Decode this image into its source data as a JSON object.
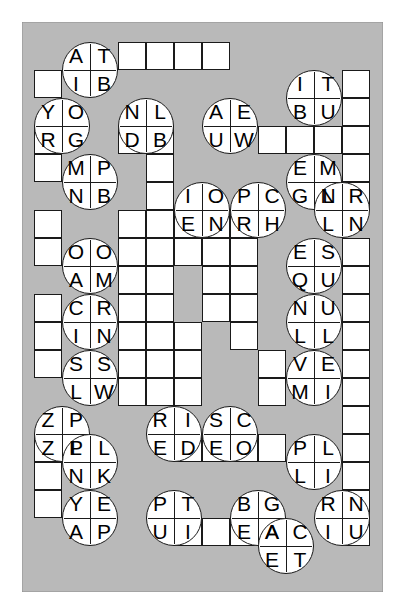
{
  "puzzle": {
    "title": "Letter Bubble Crossword Grid",
    "type": "crossword-bubble-grid",
    "grid": {
      "columns": 12,
      "rows": 19,
      "cell_px": 28,
      "origin_x": 12,
      "origin_y": 20
    },
    "colors": {
      "board_background": "#b9b9b9",
      "cell_fill": "#ffffff",
      "line": "#1a1a1a",
      "page_background": "#ffffff"
    },
    "empty_cells": [
      [
        1,
        2
      ],
      [
        4,
        1
      ],
      [
        5,
        1
      ],
      [
        6,
        1
      ],
      [
        7,
        1
      ],
      [
        12,
        2
      ],
      [
        12,
        3
      ],
      [
        1,
        4
      ],
      [
        4,
        4
      ],
      [
        5,
        4
      ],
      [
        9,
        4
      ],
      [
        10,
        4
      ],
      [
        11,
        4
      ],
      [
        12,
        4
      ],
      [
        1,
        5
      ],
      [
        5,
        5
      ],
      [
        12,
        5
      ],
      [
        5,
        6
      ],
      [
        12,
        6
      ],
      [
        1,
        7
      ],
      [
        4,
        7
      ],
      [
        5,
        7
      ],
      [
        6,
        7
      ],
      [
        7,
        7
      ],
      [
        8,
        7
      ],
      [
        1,
        8
      ],
      [
        4,
        8
      ],
      [
        5,
        8
      ],
      [
        6,
        8
      ],
      [
        7,
        8
      ],
      [
        8,
        8
      ],
      [
        12,
        8
      ],
      [
        4,
        9
      ],
      [
        5,
        9
      ],
      [
        7,
        9
      ],
      [
        8,
        9
      ],
      [
        12,
        9
      ],
      [
        1,
        10
      ],
      [
        4,
        10
      ],
      [
        5,
        10
      ],
      [
        7,
        10
      ],
      [
        8,
        10
      ],
      [
        12,
        10
      ],
      [
        1,
        11
      ],
      [
        4,
        11
      ],
      [
        5,
        11
      ],
      [
        6,
        11
      ],
      [
        8,
        11
      ],
      [
        12,
        11
      ],
      [
        1,
        12
      ],
      [
        4,
        12
      ],
      [
        5,
        12
      ],
      [
        6,
        12
      ],
      [
        9,
        12
      ],
      [
        12,
        12
      ],
      [
        4,
        13
      ],
      [
        5,
        13
      ],
      [
        6,
        13
      ],
      [
        9,
        13
      ],
      [
        12,
        13
      ],
      [
        12,
        14
      ],
      [
        1,
        15
      ],
      [
        6,
        15
      ],
      [
        7,
        15
      ],
      [
        8,
        15
      ],
      [
        9,
        15
      ],
      [
        12,
        15
      ],
      [
        1,
        16
      ],
      [
        12,
        16
      ],
      [
        1,
        17
      ],
      [
        12,
        17
      ],
      [
        6,
        18
      ],
      [
        7,
        18
      ],
      [
        8,
        18
      ],
      [
        9,
        18
      ],
      [
        12,
        18
      ]
    ],
    "bubbles": [
      {
        "id": "b1",
        "col": 2,
        "row": 1,
        "letters": [
          "A",
          "T",
          "I",
          "B"
        ]
      },
      {
        "id": "b2",
        "col": 1,
        "row": 3,
        "letters": [
          "Y",
          "O",
          "R",
          "G"
        ]
      },
      {
        "id": "b3",
        "col": 4,
        "row": 3,
        "letters": [
          "N",
          "L",
          "D",
          "B"
        ]
      },
      {
        "id": "b4",
        "col": 7,
        "row": 3,
        "letters": [
          "A",
          "E",
          "U",
          "W"
        ]
      },
      {
        "id": "b5",
        "col": 10,
        "row": 2,
        "letters": [
          "I",
          "T",
          "B",
          "U"
        ]
      },
      {
        "id": "b6",
        "col": 2,
        "row": 5,
        "letters": [
          "M",
          "P",
          "N",
          "B"
        ]
      },
      {
        "id": "b7",
        "col": 10,
        "row": 5,
        "letters": [
          "E",
          "M",
          "G",
          "N"
        ]
      },
      {
        "id": "b8",
        "col": 6,
        "row": 6,
        "letters": [
          "I",
          "O",
          "E",
          "N"
        ]
      },
      {
        "id": "b9",
        "col": 8,
        "row": 6,
        "letters": [
          "P",
          "C",
          "R",
          "H"
        ]
      },
      {
        "id": "b10",
        "col": 11,
        "row": 6,
        "letters": [
          "L",
          "R",
          "L",
          "N"
        ]
      },
      {
        "id": "b11",
        "col": 2,
        "row": 8,
        "letters": [
          "O",
          "O",
          "A",
          "M"
        ]
      },
      {
        "id": "b12",
        "col": 10,
        "row": 8,
        "letters": [
          "E",
          "S",
          "Q",
          "U"
        ]
      },
      {
        "id": "b13",
        "col": 2,
        "row": 10,
        "letters": [
          "C",
          "R",
          "I",
          "N"
        ]
      },
      {
        "id": "b14",
        "col": 10,
        "row": 10,
        "letters": [
          "N",
          "U",
          "L",
          "L"
        ]
      },
      {
        "id": "b15",
        "col": 2,
        "row": 12,
        "letters": [
          "S",
          "S",
          "L",
          "W"
        ]
      },
      {
        "id": "b16",
        "col": 10,
        "row": 12,
        "letters": [
          "V",
          "E",
          "M",
          "I"
        ]
      },
      {
        "id": "b17",
        "col": 1,
        "row": 14,
        "letters": [
          "Z",
          "P",
          "Z",
          "P"
        ]
      },
      {
        "id": "b18",
        "col": 5,
        "row": 14,
        "letters": [
          "R",
          "I",
          "E",
          "D"
        ]
      },
      {
        "id": "b19",
        "col": 7,
        "row": 14,
        "letters": [
          "S",
          "C",
          "E",
          "O"
        ]
      },
      {
        "id": "b20",
        "col": 2,
        "row": 15,
        "letters": [
          "L",
          "L",
          "N",
          "K"
        ]
      },
      {
        "id": "b21",
        "col": 10,
        "row": 15,
        "letters": [
          "P",
          "L",
          "L",
          "I"
        ]
      },
      {
        "id": "b22",
        "col": 2,
        "row": 17,
        "letters": [
          "Y",
          "E",
          "A",
          "P"
        ]
      },
      {
        "id": "b23",
        "col": 5,
        "row": 17,
        "letters": [
          "P",
          "T",
          "U",
          "I"
        ]
      },
      {
        "id": "b24",
        "col": 8,
        "row": 17,
        "letters": [
          "B",
          "G",
          "E",
          "A"
        ]
      },
      {
        "id": "b25",
        "col": 11,
        "row": 17,
        "letters": [
          "R",
          "N",
          "I",
          "U"
        ]
      },
      {
        "id": "b26",
        "col": 9,
        "row": 18,
        "letters": [
          "A",
          "C",
          "E",
          "T"
        ]
      }
    ]
  }
}
